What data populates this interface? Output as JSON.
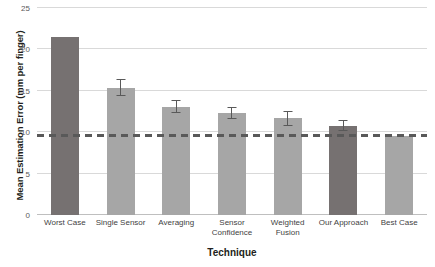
{
  "chart_data": {
    "type": "bar",
    "title": "",
    "xlabel": "Technique",
    "ylabel": "Mean Estimation Error (mm per finger)",
    "categories": [
      "Worst Case",
      "Single Sensor",
      "Averaging",
      "Sensor Confidence",
      "Weighted Fusion",
      "Our Approach",
      "Best Case"
    ],
    "values": [
      21.5,
      15.4,
      13.1,
      12.3,
      11.7,
      10.8,
      9.6
    ],
    "errors": [
      0,
      1.0,
      0.8,
      0.7,
      0.9,
      0.7,
      0
    ],
    "ylim": [
      0,
      25
    ],
    "yticks": [
      0,
      5,
      10,
      15,
      20,
      25
    ],
    "ytick_labels": [
      "0",
      "5",
      "10",
      "15",
      "20",
      "25"
    ],
    "grid": true,
    "legend": "none",
    "reference_line": {
      "value": 9.6,
      "style": "dashed",
      "color": "#595959"
    },
    "bar_colors": [
      "#767171",
      "#a6a6a6",
      "#a6a6a6",
      "#a6a6a6",
      "#a6a6a6",
      "#767171",
      "#a6a6a6"
    ],
    "highlighted": [
      "Worst Case",
      "Our Approach"
    ]
  },
  "axis": {
    "y_title": "Mean Estimation Error (mm per finger)",
    "x_title": "Technique"
  },
  "colors": {
    "bar_light": "#a6a6a6",
    "bar_dark": "#767171",
    "grid": "#d9d9d9",
    "text": "#231f20",
    "tick_text": "#5a5a5a",
    "reference": "#595959",
    "background": "#ffffff"
  }
}
